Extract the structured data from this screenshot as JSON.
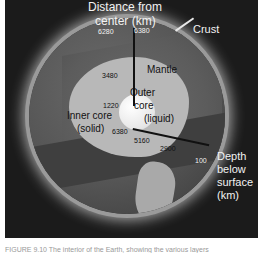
{
  "diagram": {
    "type": "earth-interior-cutaway",
    "labels": {
      "distance_title_line1": "Distance from",
      "distance_title_line2": "center (km)",
      "crust": "Crust",
      "mantle": "Mantle",
      "outer_core_line1": "Outer",
      "outer_core_line2": "core",
      "outer_core_line3": "(liquid)",
      "inner_core_line1": "Inner core",
      "inner_core_line2": "(solid)",
      "depth_title_line1": "Depth",
      "depth_title_line2": "below",
      "depth_title_line3": "surface",
      "depth_title_line4": "(km)"
    },
    "distance_from_center_km": {
      "crust_base": "6280",
      "surface": "6380",
      "core_mantle_boundary": "3480",
      "inner_core_boundary": "1220"
    },
    "depth_below_surface_km": {
      "center": "6380",
      "inner_core_boundary": "5160",
      "core_mantle_boundary": "2900",
      "crust_base": "100"
    },
    "colors": {
      "background": "#1b1b1b",
      "mantle": "#5c5c5c",
      "outer_core": "#b8b8b8",
      "inner_core": "#e6e6e6",
      "glow": "#e1e1e1"
    }
  },
  "caption": "FIGURE 9.10 The interior of the Earth, showing the various layers"
}
